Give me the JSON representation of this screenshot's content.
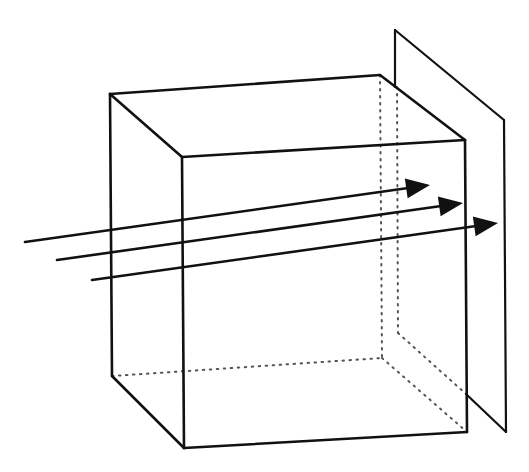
{
  "diagram": {
    "title": "",
    "colors": {
      "line": "#111111",
      "hidden_line": "#555555",
      "background": "#ffffff"
    },
    "cube": {
      "visible_edges": [
        [
          110,
          94,
          380,
          75
        ],
        [
          110,
          94,
          182,
          157
        ],
        [
          182,
          157,
          465,
          140
        ],
        [
          380,
          75,
          465,
          140
        ],
        [
          110,
          94,
          112,
          376
        ],
        [
          182,
          157,
          184,
          448
        ],
        [
          465,
          140,
          467,
          432
        ],
        [
          112,
          376,
          184,
          448
        ],
        [
          184,
          448,
          467,
          432
        ]
      ],
      "hidden_edges": [
        [
          380,
          75,
          382,
          358
        ],
        [
          112,
          376,
          382,
          358
        ],
        [
          382,
          358,
          467,
          432
        ]
      ]
    },
    "plane": {
      "visible_edges": [
        [
          395,
          30,
          395,
          87
        ],
        [
          395,
          30,
          504,
          120
        ],
        [
          504,
          120,
          506,
          432
        ],
        [
          466,
          394,
          506,
          432
        ]
      ],
      "hidden_edges": [
        [
          397,
          87,
          398,
          333
        ],
        [
          398,
          333,
          466,
          394
        ]
      ]
    },
    "arrows": [
      {
        "label": "ray-1",
        "from": [
          25,
          242
        ],
        "to": [
          430,
          185
        ]
      },
      {
        "label": "ray-2",
        "from": [
          57,
          260
        ],
        "to": [
          463,
          203
        ]
      },
      {
        "label": "ray-3",
        "from": [
          92,
          280
        ],
        "to": [
          498,
          223
        ]
      }
    ]
  }
}
